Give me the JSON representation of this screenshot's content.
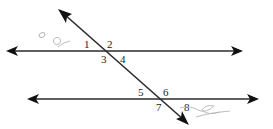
{
  "diagram": {
    "lines": [
      {
        "name": "top-parallel-line",
        "arrows": "both"
      },
      {
        "name": "bottom-parallel-line",
        "arrows": "both"
      },
      {
        "name": "transversal",
        "arrows": "both"
      }
    ],
    "angle_labels": [
      "1",
      "2",
      "3",
      "4",
      "5",
      "6",
      "7",
      "8"
    ],
    "intersections": [
      {
        "name": "top-intersection",
        "angles": [
          "1",
          "2",
          "3",
          "4"
        ]
      },
      {
        "name": "bottom-intersection",
        "angles": [
          "5",
          "6",
          "7",
          "8"
        ]
      }
    ],
    "colors": {
      "line": "#2b2b2b",
      "label": "#222222",
      "scribble": "#b5b5b5",
      "background": "#ffffff"
    },
    "annotations": {
      "pencil_marks": [
        "faint scribble top-left",
        "faint scribble bottom-right"
      ]
    }
  }
}
